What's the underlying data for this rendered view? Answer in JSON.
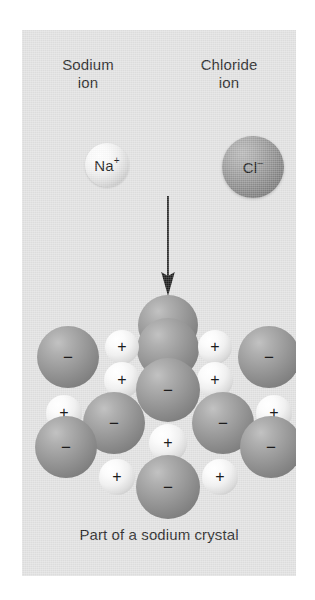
{
  "figure": {
    "background_color": "#ffffff",
    "panel_color": "#e2e2e2"
  },
  "legend": {
    "sodium": {
      "label": "Sodium\nion",
      "ion_symbol": "Na",
      "ion_charge": "+",
      "sphere_name": "sodium-ion-sphere",
      "color": "#ededed"
    },
    "chloride": {
      "label": "Chloride\nion",
      "ion_symbol": "Cl",
      "ion_charge": "–",
      "sphere_name": "chloride-ion-sphere",
      "color": "#8a8a8a"
    }
  },
  "arrow": {
    "direction": "down",
    "color": "#1c1c1c"
  },
  "caption": "Part of a sodium crystal",
  "crystal": {
    "positive_charge": "+",
    "negative_charge": "−",
    "chloride_radius": 29,
    "sodium_radius": 17,
    "ions": [
      {
        "type": "cl",
        "cx": 146,
        "cy": 30,
        "r": 30,
        "charge": ""
      },
      {
        "type": "cl",
        "cx": 146,
        "cy": 54,
        "r": 31,
        "charge": ""
      },
      {
        "type": "na",
        "cx": 100,
        "cy": 52,
        "r": 17,
        "charge": "+"
      },
      {
        "type": "na",
        "cx": 193,
        "cy": 52,
        "r": 17,
        "charge": "+"
      },
      {
        "type": "cl",
        "cx": 46,
        "cy": 62,
        "r": 31,
        "charge": "−"
      },
      {
        "type": "cl",
        "cx": 247,
        "cy": 62,
        "r": 31,
        "charge": "−"
      },
      {
        "type": "na",
        "cx": 100,
        "cy": 85,
        "r": 18,
        "charge": "+"
      },
      {
        "type": "na",
        "cx": 193,
        "cy": 85,
        "r": 18,
        "charge": "+"
      },
      {
        "type": "cl",
        "cx": 146,
        "cy": 95,
        "r": 32,
        "charge": "−"
      },
      {
        "type": "na",
        "cx": 42,
        "cy": 118,
        "r": 18,
        "charge": "+"
      },
      {
        "type": "na",
        "cx": 252,
        "cy": 118,
        "r": 18,
        "charge": "+"
      },
      {
        "type": "cl",
        "cx": 92,
        "cy": 128,
        "r": 31,
        "charge": "−"
      },
      {
        "type": "cl",
        "cx": 201,
        "cy": 128,
        "r": 31,
        "charge": "−"
      },
      {
        "type": "cl",
        "cx": 44,
        "cy": 152,
        "r": 31,
        "charge": "−"
      },
      {
        "type": "cl",
        "cx": 249,
        "cy": 152,
        "r": 31,
        "charge": "−"
      },
      {
        "type": "na",
        "cx": 146,
        "cy": 148,
        "r": 19,
        "charge": "+"
      },
      {
        "type": "na",
        "cx": 95,
        "cy": 182,
        "r": 18,
        "charge": "+"
      },
      {
        "type": "na",
        "cx": 198,
        "cy": 182,
        "r": 18,
        "charge": "+"
      },
      {
        "type": "cl",
        "cx": 146,
        "cy": 192,
        "r": 32,
        "charge": "−"
      }
    ]
  }
}
